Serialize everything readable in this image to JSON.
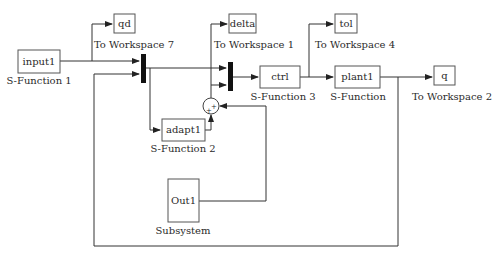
{
  "diagram": {
    "type": "simulink-block-diagram",
    "colors": {
      "line": "#333333",
      "block_border": "#555555",
      "mux_fill": "#111111",
      "background": "#ffffff"
    },
    "top_strip": {
      "clipped_text_left": "",
      "clipped_text_right": ""
    },
    "blocks": [
      {
        "id": "input1",
        "kind": "s-function",
        "text": "input1",
        "caption": "S-Function 1"
      },
      {
        "id": "qd",
        "kind": "to-workspace",
        "text": "qd",
        "caption": "To Workspace 7"
      },
      {
        "id": "delta",
        "kind": "to-workspace",
        "text": "delta",
        "caption": "To Workspace 1"
      },
      {
        "id": "tol",
        "kind": "to-workspace",
        "text": "tol",
        "caption": "To Workspace 4"
      },
      {
        "id": "ctrl",
        "kind": "s-function",
        "text": "ctrl",
        "caption": "S-Function 3"
      },
      {
        "id": "plant1",
        "kind": "s-function",
        "text": "plant1",
        "caption": "S-Function"
      },
      {
        "id": "q",
        "kind": "to-workspace",
        "text": "q",
        "caption": "To Workspace 2"
      },
      {
        "id": "adapt1",
        "kind": "s-function",
        "text": "adapt1",
        "caption": "S-Function 2"
      },
      {
        "id": "out1",
        "kind": "subsystem",
        "text": "Out1",
        "caption": "Subsystem"
      },
      {
        "id": "mux1",
        "kind": "mux",
        "text": "",
        "caption": ""
      },
      {
        "id": "mux2",
        "kind": "mux",
        "text": "",
        "caption": ""
      },
      {
        "id": "sum",
        "kind": "sum",
        "text": "",
        "caption": "",
        "signs": [
          "+",
          "+"
        ]
      }
    ],
    "connections": [
      {
        "from": "input1",
        "to": "mux1"
      },
      {
        "from": "input1",
        "to": "qd"
      },
      {
        "from": "plant1",
        "to": "mux1",
        "note": "feedback"
      },
      {
        "from": "mux1",
        "to": "mux2"
      },
      {
        "from": "mux1",
        "to": "adapt1"
      },
      {
        "from": "adapt1",
        "to": "sum"
      },
      {
        "from": "out1",
        "to": "sum"
      },
      {
        "from": "sum",
        "to": "mux2"
      },
      {
        "from": "sum",
        "to": "delta"
      },
      {
        "from": "mux2",
        "to": "ctrl"
      },
      {
        "from": "ctrl",
        "to": "plant1"
      },
      {
        "from": "ctrl",
        "to": "tol"
      },
      {
        "from": "plant1",
        "to": "q"
      }
    ]
  }
}
